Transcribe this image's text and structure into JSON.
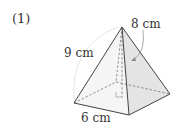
{
  "problem": {
    "number_label": "(1)"
  },
  "figure": {
    "shape": "square pyramid",
    "labels": {
      "lateral_edge": "9 cm",
      "slant_height": "8 cm",
      "base_edge": "6 cm"
    },
    "colors": {
      "edge": "#444444",
      "right_face": "#e6e6e6",
      "front_face": "#f4f4f4",
      "hidden_line": "#777777",
      "arc": "#cccccc"
    }
  }
}
